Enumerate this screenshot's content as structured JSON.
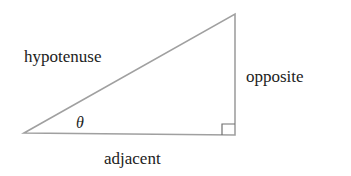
{
  "diagram": {
    "type": "right-triangle",
    "labels": {
      "hypotenuse": "hypotenuse",
      "opposite": "opposite",
      "adjacent": "adjacent",
      "angle": "θ"
    },
    "colors": {
      "line": "#9a9a9a",
      "text": "#222222"
    }
  }
}
